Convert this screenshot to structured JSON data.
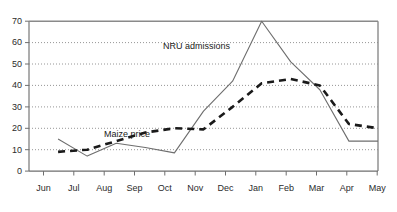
{
  "chart_data": {
    "type": "line",
    "title": "",
    "xlabel": "",
    "ylabel": "",
    "categories": [
      "Jun",
      "Jul",
      "Aug",
      "Sep",
      "Oct",
      "Nov",
      "Dec",
      "Jan",
      "Feb",
      "Mar",
      "Apr",
      "May"
    ],
    "ylim": [
      0,
      70
    ],
    "yticks": [
      0,
      10,
      20,
      30,
      40,
      50,
      60,
      70
    ],
    "ytick_labels": [
      "0",
      "10",
      "20",
      "30",
      "40",
      "50",
      "60",
      "70"
    ],
    "grid": "horizontal-dotted",
    "legend": "inline-annotations",
    "series": [
      {
        "name": "NRU admissions",
        "style": "solid-thin",
        "color": "#6e6e6e",
        "values": [
          15,
          7,
          13,
          11,
          8.5,
          28,
          42,
          70,
          51,
          38,
          14,
          14
        ]
      },
      {
        "name": "Maize price",
        "style": "dashed-thick",
        "color": "#1a1a1a",
        "values": [
          9,
          10,
          14,
          18,
          20,
          19.5,
          30,
          41,
          43,
          40,
          22,
          20
        ]
      }
    ],
    "annotations": [
      {
        "text": "NRU admissions",
        "x_month": "Dec",
        "y_value": 58
      },
      {
        "text": "Maize price",
        "x_month": "Sep",
        "y_value": 24
      }
    ]
  },
  "axis": {
    "y_tick_0": "0",
    "y_tick_10": "10",
    "y_tick_20": "20",
    "y_tick_30": "30",
    "y_tick_40": "40",
    "y_tick_50": "50",
    "y_tick_60": "60",
    "y_tick_70": "70",
    "x_tick_jun": "Jun",
    "x_tick_jul": "Jul",
    "x_tick_aug": "Aug",
    "x_tick_sep": "Sep",
    "x_tick_oct": "Oct",
    "x_tick_nov": "Nov",
    "x_tick_dec": "Dec",
    "x_tick_jan": "Jan",
    "x_tick_feb": "Feb",
    "x_tick_mar": "Mar",
    "x_tick_apr": "Apr",
    "x_tick_may": "May"
  },
  "labels": {
    "nru_admissions": "NRU admissions",
    "maize_price": "Maize price"
  },
  "colors": {
    "frame": "#8a8a8a",
    "grid": "#8a8a8a",
    "nru_line": "#6e6e6e",
    "maize_line": "#1a1a1a",
    "text": "#1a1a1a"
  }
}
